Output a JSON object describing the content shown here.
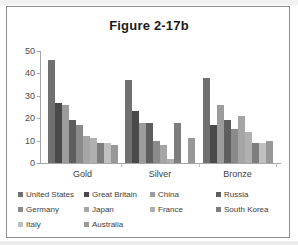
{
  "chart_data": {
    "type": "bar",
    "title": "Figure 2-17b",
    "xlabel": "",
    "ylabel": "",
    "ylim": [
      0,
      50
    ],
    "yticks": [
      0,
      10,
      20,
      30,
      40,
      50
    ],
    "grid": false,
    "legend_position": "bottom",
    "categories": [
      "Gold",
      "Silver",
      "Bronze"
    ],
    "series": [
      {
        "name": "United States",
        "color": "#707070",
        "values": [
          46,
          37,
          38
        ]
      },
      {
        "name": "Great Britain",
        "color": "#4a4a4a",
        "values": [
          27,
          23,
          17
        ]
      },
      {
        "name": "China",
        "color": "#9c9c9c",
        "values": [
          26,
          18,
          26
        ]
      },
      {
        "name": "Russia",
        "color": "#5e5e5e",
        "values": [
          19,
          18,
          19
        ]
      },
      {
        "name": "Germany",
        "color": "#8a8a8a",
        "values": [
          17,
          10,
          15
        ]
      },
      {
        "name": "Japan",
        "color": "#a5a5a5",
        "values": [
          12,
          8,
          21
        ]
      },
      {
        "name": "France",
        "color": "#b0b0b0",
        "values": [
          11,
          2,
          14
        ]
      },
      {
        "name": "South Korea",
        "color": "#7d7d7d",
        "values": [
          9,
          18,
          9
        ]
      },
      {
        "name": "Italy",
        "color": "#c0c0c0",
        "values": [
          9,
          0,
          9
        ]
      },
      {
        "name": "Australia",
        "color": "#989898",
        "values": [
          8,
          11,
          10
        ]
      }
    ]
  },
  "title": {
    "text": "Figure 2-17b"
  },
  "axis": {
    "y_ticks": [
      "0",
      "10",
      "20",
      "30",
      "40",
      "50"
    ],
    "x_labels": [
      "Gold",
      "Silver",
      "Bronze"
    ]
  },
  "legend": {
    "rows": [
      [
        {
          "label": "United States",
          "color": "#707070"
        },
        {
          "label": "Great Britain",
          "color": "#4a4a4a"
        },
        {
          "label": "China",
          "color": "#9c9c9c"
        },
        {
          "label": "Russia",
          "color": "#5e5e5e"
        }
      ],
      [
        {
          "label": "Germany",
          "color": "#8a8a8a"
        },
        {
          "label": "Japan",
          "color": "#a5a5a5"
        },
        {
          "label": "France",
          "color": "#b0b0b0"
        },
        {
          "label": "South Korea",
          "color": "#7d7d7d"
        }
      ],
      [
        {
          "label": "Italy",
          "color": "#c0c0c0"
        },
        {
          "label": "Australia",
          "color": "#989898"
        }
      ]
    ]
  }
}
